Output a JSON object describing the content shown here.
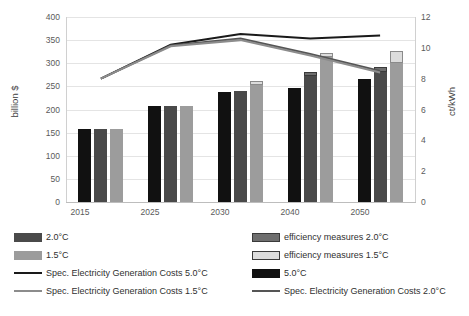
{
  "chart_data": {
    "type": "bar",
    "title": "",
    "categories": [
      "2015",
      "2025",
      "2030",
      "2040",
      "2050"
    ],
    "xlabel": "",
    "ylabel": "billion $",
    "ylabel_secondary": "ct/kWh",
    "ylim": [
      0,
      400
    ],
    "ylim_secondary": [
      0,
      12
    ],
    "yticks": [
      0,
      50,
      100,
      150,
      200,
      250,
      300,
      350,
      400
    ],
    "yticks_secondary": [
      0,
      2,
      4,
      6,
      8,
      10,
      12
    ],
    "grid": true,
    "legend_position": "bottom",
    "series": [
      {
        "name": "5.0°C",
        "kind": "bar",
        "color": "#111111",
        "axis": "left",
        "values": [
          157,
          208,
          238,
          247,
          265
        ]
      },
      {
        "name": "2.0°C",
        "kind": "bar",
        "color": "#4a4a4a",
        "axis": "left",
        "values": [
          157,
          208,
          241,
          272,
          281
        ]
      },
      {
        "name": "efficiency measures 2.0°C",
        "kind": "bar-stack",
        "color": "#6e6e6e",
        "axis": "left",
        "stacked_on": "2.0°C",
        "values": [
          0,
          0,
          0,
          9,
          10
        ]
      },
      {
        "name": "1.5°C",
        "kind": "bar",
        "color": "#9c9c9c",
        "axis": "left",
        "values": [
          157,
          207,
          252,
          313,
          301
        ]
      },
      {
        "name": "efficiency measures 1.5°C",
        "kind": "bar-stack",
        "color": "#dcdcdc",
        "axis": "left",
        "stacked_on": "1.5°C",
        "values": [
          0,
          0,
          9,
          9,
          26
        ]
      },
      {
        "name": "Spec. Electricity Generation Costs 5.0°C",
        "kind": "line",
        "color": "#1a1a1a",
        "axis": "right",
        "values": [
          8.0,
          10.2,
          10.9,
          10.6,
          10.8
        ]
      },
      {
        "name": "Spec. Electricity Generation Costs 2.0°C",
        "kind": "line",
        "color": "#555555",
        "axis": "right",
        "values": [
          8.0,
          10.15,
          10.6,
          9.6,
          8.5
        ]
      },
      {
        "name": "Spec. Electricity Generation Costs 1.5°C",
        "kind": "line",
        "color": "#8c8c8c",
        "axis": "right",
        "values": [
          8.0,
          10.1,
          10.5,
          9.5,
          8.4
        ]
      }
    ]
  },
  "axes": {
    "left_title": "billion $",
    "right_title": "ct/kWh",
    "left_ticks": [
      "400",
      "350",
      "300",
      "250",
      "200",
      "150",
      "100",
      "50",
      "0"
    ],
    "right_ticks": [
      "12",
      "10",
      "8",
      "6",
      "4",
      "2",
      "0"
    ],
    "x_ticks": [
      "2015",
      "2025",
      "2030",
      "2040",
      "2050"
    ]
  },
  "legend": {
    "left_column": [
      {
        "label": "2.0°C",
        "marker": "swatch",
        "color": "#4a4a4a"
      },
      {
        "label": "1.5°C",
        "marker": "swatch",
        "color": "#9c9c9c"
      },
      {
        "label": "Spec. Electricity Generation Costs 5.0°C",
        "marker": "line",
        "color": "#1a1a1a"
      },
      {
        "label": "Spec. Electricity Generation Costs 1.5°C",
        "marker": "line",
        "color": "#8c8c8c"
      }
    ],
    "right_column": [
      {
        "label": "efficiency measures 2.0°C",
        "marker": "swatch-outline",
        "color": "#6e6e6e"
      },
      {
        "label": "efficiency measures 1.5°C",
        "marker": "swatch-outline",
        "color": "#dcdcdc"
      },
      {
        "label": "5.0°C",
        "marker": "swatch",
        "color": "#111111"
      },
      {
        "label": "Spec. Electricity Generation Costs 2.0°C",
        "marker": "line",
        "color": "#555555"
      }
    ]
  }
}
